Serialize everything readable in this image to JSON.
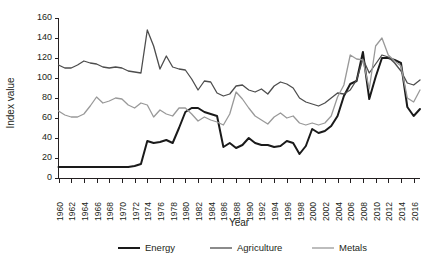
{
  "chart_data": {
    "type": "line",
    "title": "",
    "xlabel": "Year",
    "ylabel": "Index value",
    "xlim": [
      1960,
      2017
    ],
    "ylim": [
      0,
      160
    ],
    "ytick_step": 20,
    "yticks": [
      0,
      20,
      40,
      60,
      80,
      100,
      120,
      140,
      160
    ],
    "xtick_labels": [
      "1960",
      "1962",
      "1964",
      "1966",
      "1968",
      "1970",
      "1972",
      "1974",
      "1976",
      "1978",
      "1980",
      "1982",
      "1984",
      "1986",
      "1988",
      "1990",
      "1992",
      "1994",
      "1996",
      "1998",
      "2000",
      "2002",
      "2004",
      "2006",
      "2008",
      "2010",
      "2012",
      "2014",
      "2016"
    ],
    "xtick_values": [
      1960,
      1962,
      1964,
      1966,
      1968,
      1970,
      1972,
      1974,
      1976,
      1978,
      1980,
      1982,
      1984,
      1986,
      1988,
      1990,
      1992,
      1994,
      1996,
      1998,
      2000,
      2002,
      2004,
      2006,
      2008,
      2010,
      2012,
      2014,
      2016
    ],
    "grid": false,
    "legend_position": "bottom",
    "x": [
      1960,
      1961,
      1962,
      1963,
      1964,
      1965,
      1966,
      1967,
      1968,
      1969,
      1970,
      1971,
      1972,
      1973,
      1974,
      1975,
      1976,
      1977,
      1978,
      1979,
      1980,
      1981,
      1982,
      1983,
      1984,
      1985,
      1986,
      1987,
      1988,
      1989,
      1990,
      1991,
      1992,
      1993,
      1994,
      1995,
      1996,
      1997,
      1998,
      1999,
      2000,
      2001,
      2002,
      2003,
      2004,
      2005,
      2006,
      2007,
      2008,
      2009,
      2010,
      2011,
      2012,
      2013,
      2014,
      2015,
      2016,
      2017
    ],
    "series": [
      {
        "name": "Energy",
        "color": "#1a1a1a",
        "width": 2.0,
        "values": [
          11,
          11,
          11,
          11,
          11,
          11,
          11,
          11,
          11,
          11,
          11,
          11,
          12,
          14,
          37,
          35,
          36,
          38,
          35,
          50,
          66,
          70,
          70,
          66,
          64,
          62,
          31,
          35,
          30,
          33,
          40,
          35,
          33,
          33,
          31,
          32,
          37,
          35,
          24,
          32,
          49,
          45,
          47,
          52,
          62,
          82,
          94,
          97,
          126,
          79,
          101,
          120,
          120,
          118,
          115,
          71,
          62,
          69
        ]
      },
      {
        "name": "Agriculture",
        "color": "#4d4d4d",
        "width": 1.3,
        "values": [
          113,
          110,
          110,
          113,
          117,
          115,
          114,
          111,
          110,
          111,
          110,
          107,
          106,
          105,
          148,
          132,
          109,
          122,
          111,
          109,
          108,
          99,
          88,
          97,
          96,
          85,
          82,
          84,
          92,
          93,
          88,
          86,
          89,
          84,
          92,
          96,
          94,
          90,
          80,
          76,
          74,
          72,
          75,
          80,
          85,
          84,
          88,
          98,
          119,
          105,
          114,
          123,
          121,
          115,
          107,
          95,
          93,
          98
        ]
      },
      {
        "name": "Metals",
        "color": "#999999",
        "width": 1.3,
        "values": [
          67,
          63,
          61,
          61,
          64,
          72,
          81,
          75,
          77,
          80,
          79,
          73,
          70,
          75,
          73,
          61,
          68,
          64,
          62,
          70,
          70,
          64,
          57,
          61,
          58,
          56,
          53,
          64,
          86,
          79,
          70,
          62,
          58,
          54,
          61,
          65,
          60,
          62,
          55,
          53,
          55,
          53,
          55,
          62,
          81,
          93,
          123,
          119,
          118,
          89,
          132,
          140,
          123,
          117,
          112,
          80,
          76,
          88
        ]
      }
    ]
  },
  "legend": {
    "items": [
      {
        "label": "Energy"
      },
      {
        "label": "Agriculture"
      },
      {
        "label": "Metals"
      }
    ]
  }
}
